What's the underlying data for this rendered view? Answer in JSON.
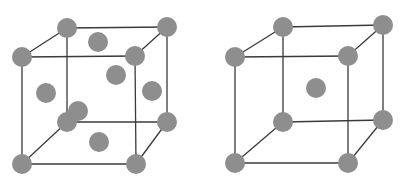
{
  "diagram": {
    "style": {
      "atom_color": "#8e8e8e",
      "edge_color": "#3a3a3a",
      "atom_radius": 10
    },
    "cells": [
      {
        "name": "face-centered-cubic",
        "corners": {
          "btl": [
            67,
            28
          ],
          "btr": [
            167,
            27
          ],
          "ftl": [
            22,
            57
          ],
          "ftr": [
            135,
            56
          ],
          "bbl": [
            67,
            122
          ],
          "bbr": [
            167,
            122
          ],
          "fbl": [
            22,
            164
          ],
          "fbr": [
            136,
            164
          ]
        },
        "face_centers": [
          [
            98,
            42
          ],
          [
            116,
            75
          ],
          [
            46,
            93
          ],
          [
            152,
            91
          ],
          [
            78,
            111
          ],
          [
            99,
            142
          ]
        ]
      },
      {
        "name": "body-centered-cubic",
        "corners": {
          "btl": [
            283,
            27
          ],
          "btr": [
            383,
            25
          ],
          "ftl": [
            235,
            57
          ],
          "ftr": [
            348,
            56
          ],
          "bbl": [
            283,
            122
          ],
          "bbr": [
            383,
            120
          ],
          "fbl": [
            235,
            163
          ],
          "fbr": [
            348,
            163
          ]
        },
        "body_center": [
          316,
          88
        ]
      }
    ]
  }
}
